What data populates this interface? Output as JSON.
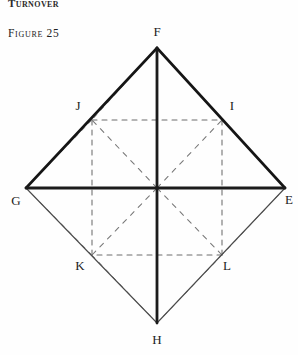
{
  "page": {
    "running_head": "Turnover",
    "figure_caption": "Figure 25",
    "background_color": "#fefefe",
    "ink_color": "#1a1a1a"
  },
  "figure": {
    "type": "geometric-diagram",
    "canvas": {
      "width": 298,
      "height": 355
    },
    "center": {
      "x": 157,
      "y": 188
    },
    "vertices": [
      {
        "id": "F",
        "label": "F",
        "x": 157,
        "y": 48,
        "label_x": 157,
        "label_y": 36,
        "position": "top"
      },
      {
        "id": "E",
        "label": "E",
        "x": 285,
        "y": 188,
        "label_x": 289,
        "label_y": 204,
        "position": "right"
      },
      {
        "id": "H",
        "label": "H",
        "x": 157,
        "y": 323,
        "label_x": 157,
        "label_y": 344,
        "position": "bottom"
      },
      {
        "id": "G",
        "label": "G",
        "x": 26,
        "y": 188,
        "label_x": 16,
        "label_y": 205,
        "position": "left"
      },
      {
        "id": "J",
        "label": "J",
        "x": 92,
        "y": 120,
        "label_x": 78,
        "label_y": 110,
        "position": "upper-left"
      },
      {
        "id": "I",
        "label": "I",
        "x": 222,
        "y": 120,
        "label_x": 232,
        "label_y": 110,
        "position": "upper-right"
      },
      {
        "id": "K",
        "label": "K",
        "x": 92,
        "y": 255,
        "label_x": 80,
        "label_y": 270,
        "position": "lower-left"
      },
      {
        "id": "L",
        "label": "L",
        "x": 222,
        "y": 255,
        "label_x": 227,
        "label_y": 270,
        "position": "lower-right"
      }
    ],
    "solid_edges": [
      {
        "from": "G",
        "to": "F",
        "weight": "heavy"
      },
      {
        "from": "F",
        "to": "E",
        "weight": "heavy"
      },
      {
        "from": "G",
        "to": "H",
        "weight": "light"
      },
      {
        "from": "H",
        "to": "E",
        "weight": "light"
      },
      {
        "from": "F",
        "to": "H",
        "weight": "heavy",
        "kind": "vertical-axis"
      },
      {
        "from": "G",
        "to": "E",
        "weight": "heavy",
        "kind": "horizontal-axis"
      }
    ],
    "dashed_edges": [
      {
        "from": "J",
        "to": "I",
        "kind": "inner-square-top"
      },
      {
        "from": "I",
        "to": "L",
        "kind": "inner-square-right"
      },
      {
        "from": "L",
        "to": "K",
        "kind": "inner-square-bottom"
      },
      {
        "from": "K",
        "to": "J",
        "kind": "inner-square-left"
      },
      {
        "from": "center",
        "to": "J",
        "kind": "spoke"
      },
      {
        "from": "center",
        "to": "I",
        "kind": "spoke"
      },
      {
        "from": "center",
        "to": "K",
        "kind": "spoke"
      },
      {
        "from": "center",
        "to": "L",
        "kind": "spoke"
      },
      {
        "from": "F",
        "to": "J",
        "kind": "hidden-edge"
      },
      {
        "from": "F",
        "to": "I",
        "kind": "hidden-edge"
      },
      {
        "from": "H",
        "to": "K",
        "kind": "hidden-edge"
      },
      {
        "from": "H",
        "to": "L",
        "kind": "hidden-edge"
      },
      {
        "from": "G",
        "to": "J",
        "kind": "hidden-edge"
      },
      {
        "from": "G",
        "to": "K",
        "kind": "hidden-edge"
      },
      {
        "from": "E",
        "to": "I",
        "kind": "hidden-edge"
      },
      {
        "from": "E",
        "to": "L",
        "kind": "hidden-edge"
      }
    ]
  }
}
